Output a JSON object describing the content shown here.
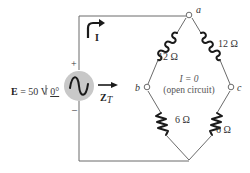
{
  "source": {
    "label_bold": "E",
    "label_rest": " = 50 V ",
    "phase": "0°",
    "plus": "+",
    "minus": "–",
    "fill_color": "#c8c8c8"
  },
  "current": {
    "label": "I"
  },
  "impedance": {
    "label_main": "Z",
    "label_sub": "T"
  },
  "nodes": {
    "a": "a",
    "b": "b",
    "c": "c"
  },
  "branches": {
    "inductor_left": "12 Ω",
    "inductor_right": "12 Ω",
    "resistor_left": "6 Ω",
    "resistor_right": "6 Ω"
  },
  "bridge_note": {
    "line1": "I = 0",
    "line2": "(open circuit)"
  }
}
